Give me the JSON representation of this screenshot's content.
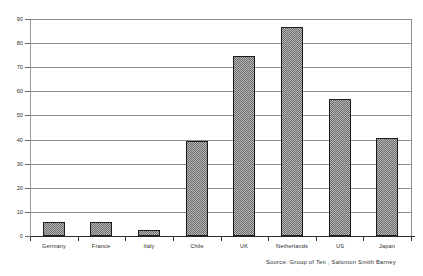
{
  "chart_data": {
    "type": "bar",
    "title": "",
    "subtitle": "",
    "xlabel": "",
    "ylabel": "",
    "categories": [
      "Germany",
      "France",
      "Italy",
      "Chile",
      "UK",
      "Netherlands",
      "US",
      "Japan"
    ],
    "values": [
      5.7,
      5.6,
      2.6,
      39.5,
      74.5,
      86.5,
      57,
      40.7
    ],
    "ylim": [
      0,
      90
    ],
    "yticks": [
      0,
      10,
      20,
      30,
      40,
      50,
      60,
      70,
      80,
      90
    ],
    "ytick_labels": [
      "0",
      "10",
      "20",
      "30",
      "40",
      "50",
      "60",
      "70",
      "80",
      "90"
    ],
    "grid": true,
    "grid_axis": "y",
    "legend": false,
    "legend_position": "none",
    "bar_fill": "#b4b4b4",
    "bar_pattern": "checkerboard-dither",
    "bar_edge_color": "#1c1c1c",
    "axis_color": "#2a2a2a",
    "gridline_color": "#8e8e8e",
    "background": "#ffffff"
  },
  "annotations": {
    "source": "Source: Group of Ten ,  Salomon Smith Barney"
  }
}
